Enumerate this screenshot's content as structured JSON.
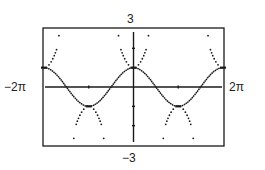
{
  "chart_data": {
    "type": "line",
    "title": "",
    "xlabel": "",
    "ylabel": "",
    "window": {
      "xmin": "-2π",
      "xmax": "2π",
      "ymin": "-3",
      "ymax": "3"
    },
    "xlim": [
      -6.2832,
      6.2832
    ],
    "ylim": [
      -3,
      3
    ],
    "x_ticks_step": "π",
    "y_ticks_step": 1,
    "grid": false,
    "series": [
      {
        "name": "y = cos x",
        "style": "connected",
        "function": "cos",
        "x_range": [
          -6.2832,
          6.2832
        ]
      },
      {
        "name": "dotted parabolas at extrema",
        "style": "dotted",
        "function": "parabola",
        "curvature": 1.2,
        "vertices": [
          {
            "x": -6.2832,
            "y": 1,
            "opens": "up"
          },
          {
            "x": -3.1416,
            "y": -1,
            "opens": "down"
          },
          {
            "x": 0,
            "y": 1,
            "opens": "up"
          },
          {
            "x": 3.1416,
            "y": -1,
            "opens": "down"
          },
          {
            "x": 6.2832,
            "y": 1,
            "opens": "up"
          }
        ]
      }
    ],
    "labels": {
      "ymax": "3",
      "ymin": "−3",
      "xmin": "−2π",
      "xmax": "2π"
    },
    "colors": {
      "ink": "#1a1a1a",
      "background": "#ffffff"
    }
  }
}
